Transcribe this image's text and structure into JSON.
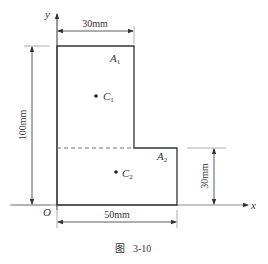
{
  "figure": {
    "caption_prefix": "图",
    "caption_number": "3-10"
  },
  "axes": {
    "x_label": "x",
    "y_label": "y",
    "origin_label": "O"
  },
  "dimensions": {
    "top_width": "30mm",
    "total_height": "100mm",
    "bottom_height": "30mm",
    "bottom_width": "50mm"
  },
  "regions": [
    {
      "area_label": "A",
      "area_sub": "1",
      "centroid_label": "C",
      "centroid_sub": "1"
    },
    {
      "area_label": "A",
      "area_sub": "2",
      "centroid_label": "C",
      "centroid_sub": "2"
    }
  ],
  "colors": {
    "line": "#333333",
    "dashed": "#777777",
    "ext_line": "#999999"
  }
}
